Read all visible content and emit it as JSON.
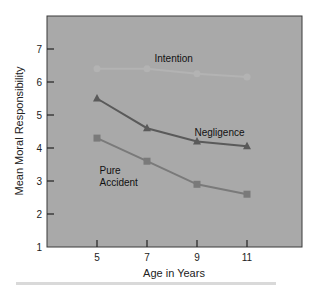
{
  "chart_data": {
    "type": "line",
    "title": "",
    "xlabel": "Age in Years",
    "ylabel": "Mean Moral Responsibility",
    "x": [
      5,
      7,
      9,
      11
    ],
    "x_tick_labels": [
      "5",
      "7",
      "9",
      "11"
    ],
    "y_tick_labels": [
      "1",
      "2",
      "3",
      "4",
      "5",
      "6",
      "7"
    ],
    "xlim": [
      3,
      13.2
    ],
    "ylim": [
      1,
      8
    ],
    "grid": false,
    "legend": "inline labels",
    "series": [
      {
        "name": "Intention",
        "values": [
          6.4,
          6.4,
          6.25,
          6.15
        ],
        "color": "#b3b3b3",
        "marker": "circle"
      },
      {
        "name": "Negligence",
        "values": [
          5.5,
          4.6,
          4.2,
          4.05
        ],
        "color": "#5a5a5a",
        "marker": "triangle"
      },
      {
        "name": "Pure Accident",
        "values": [
          4.3,
          3.6,
          2.9,
          2.6
        ],
        "color": "#7a7a7a",
        "marker": "square"
      }
    ],
    "annotations": [
      {
        "text": "Intention",
        "x": 7.3,
        "y": 6.6
      },
      {
        "text": "Negligence",
        "x": 8.9,
        "y": 4.35
      },
      {
        "text": "Pure",
        "x": 5.1,
        "y": 3.2
      },
      {
        "text": "Accident",
        "x": 5.1,
        "y": 2.85
      }
    ]
  },
  "colors": {
    "plot_background": "#a9a9a9",
    "frame": "#3a3a3a"
  }
}
